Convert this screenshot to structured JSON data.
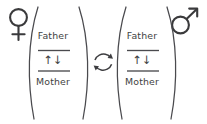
{
  "figure": {
    "background_color": "#ffffff",
    "line_color": "#4a4a4e",
    "text_color": "#3f3f43",
    "width": 207,
    "height": 124
  },
  "symbols": {
    "female": {
      "name": "venus-symbol",
      "label": "♀",
      "meaning": "female"
    },
    "male": {
      "name": "mars-symbol",
      "label": "♂",
      "meaning": "male"
    },
    "exchange": {
      "name": "cycle-arrows-icon",
      "label": "↻",
      "meaning": "recombination / exchange"
    }
  },
  "groups": [
    {
      "id": "female-genome",
      "sex": "female",
      "sex_symbol": "♀",
      "numerator": "Father",
      "allele": "↑↓",
      "denominator": "Mother"
    },
    {
      "id": "male-genome",
      "sex": "male",
      "sex_symbol": "♂",
      "numerator": "Father",
      "allele": "↑↓",
      "denominator": "Mother"
    }
  ]
}
